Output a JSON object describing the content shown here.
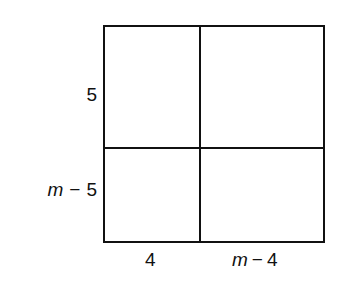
{
  "diagram": {
    "type": "area-model",
    "line_color": "#111111",
    "background": "#ffffff",
    "side_labels": {
      "left_top": "5",
      "left_bottom": {
        "variable": "m",
        "operator": "−",
        "constant": "5"
      }
    },
    "bottom_labels": {
      "left": "4",
      "right": {
        "variable": "m",
        "operator": "−",
        "constant": "4"
      }
    },
    "regions": [
      {
        "row": 1,
        "col": 1,
        "height": "5",
        "width": "4"
      },
      {
        "row": 1,
        "col": 2,
        "height": "5",
        "width": "m − 4"
      },
      {
        "row": 2,
        "col": 1,
        "height": "m − 5",
        "width": "4"
      },
      {
        "row": 2,
        "col": 2,
        "height": "m − 5",
        "width": "m − 4"
      }
    ]
  }
}
